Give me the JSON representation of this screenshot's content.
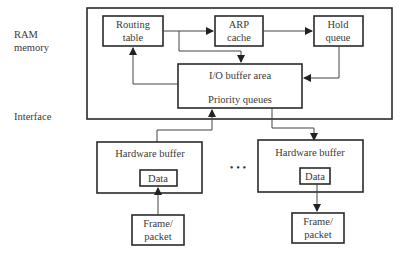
{
  "side_labels": {
    "ram_line1": "RAM",
    "ram_line2": "memory",
    "interface": "Interface"
  },
  "ram_memory": {
    "routing_table": {
      "line1": "Routing",
      "line2": "table"
    },
    "arp_cache": {
      "line1": "ARP",
      "line2": "cache"
    },
    "hold_queue": {
      "line1": "Hold",
      "line2": "queue"
    },
    "io_buffer": {
      "line1": "I/O buffer area",
      "line2": "Priority queues"
    }
  },
  "interfaces": [
    {
      "title": "Hardware buffer",
      "data_label": "Data",
      "frame": {
        "line1": "Frame/",
        "line2": "packet"
      },
      "direction": "inbound"
    },
    {
      "title": "Hardware buffer",
      "data_label": "Data",
      "frame": {
        "line1": "Frame/",
        "line2": "packet"
      },
      "direction": "outbound"
    }
  ],
  "ellipsis": "• • •",
  "colors": {
    "stroke": "#2a2a2a",
    "text": "#3a3a3a",
    "background": "#ffffff"
  }
}
